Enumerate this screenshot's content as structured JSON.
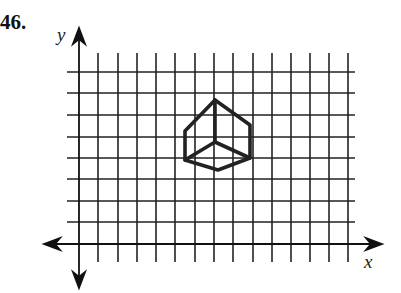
{
  "problem": {
    "number": "46."
  },
  "axes": {
    "x_label": "x",
    "y_label": "y",
    "origin_px": [
      79,
      244
    ],
    "x_axis": {
      "x1": 44,
      "x2": 382,
      "y": 244
    },
    "y_axis": {
      "x": 79,
      "y1": 28,
      "y2": 288
    }
  },
  "grid": {
    "vertical_lines_x": [
      98,
      118,
      137,
      156,
      175,
      195,
      214,
      233,
      253,
      272,
      291,
      310,
      329,
      348
    ],
    "vertical_span": [
      53,
      262
    ],
    "horizontal_lines_y": [
      72,
      93,
      115,
      137,
      158,
      179,
      201,
      222
    ],
    "horizontal_span": [
      67,
      355
    ],
    "line_color": "#222222"
  },
  "figure": {
    "name": "cube",
    "stroke": "#222222",
    "outline": [
      [
        215,
        100
      ],
      [
        250,
        125
      ],
      [
        250,
        158
      ],
      [
        218,
        170
      ],
      [
        185,
        160
      ],
      [
        185,
        131
      ],
      [
        215,
        100
      ]
    ],
    "inner_edges": [
      [
        [
          215,
          100
        ],
        [
          215,
          142
        ]
      ],
      [
        [
          215,
          142
        ],
        [
          185,
          160
        ]
      ],
      [
        [
          215,
          142
        ],
        [
          250,
          158
        ]
      ]
    ]
  }
}
